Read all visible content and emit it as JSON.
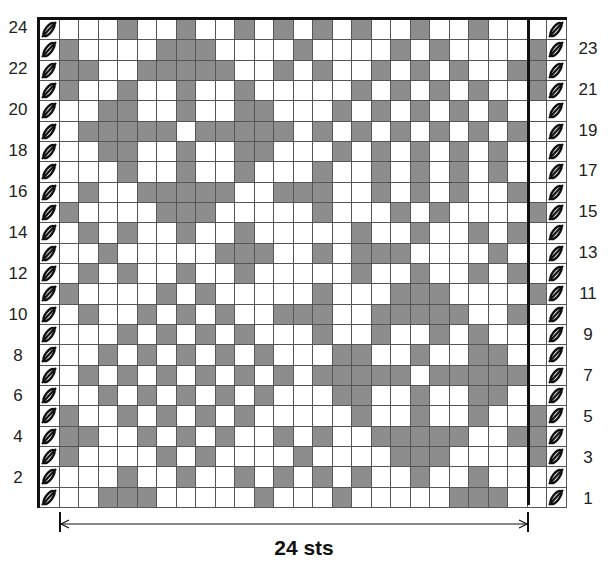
{
  "chart_data": {
    "type": "table",
    "columns": 24,
    "rows": 24,
    "legend": {
      "0": "background (white)",
      "1": "contrast (gray)",
      "edge": "edge stitch (slashed)"
    },
    "colors": {
      "contrast": "#8d8d8d",
      "background": "#ffffff",
      "border": "#111111"
    },
    "width_label": "24 sts",
    "left_row_labels": [
      "24",
      "22",
      "20",
      "18",
      "16",
      "14",
      "12",
      "10",
      "8",
      "6",
      "4",
      "2"
    ],
    "right_row_labels": [
      "23",
      "21",
      "19",
      "17",
      "15",
      "13",
      "11",
      "9",
      "7",
      "5",
      "3",
      "1"
    ],
    "grid_top_to_bottom": [
      "0001001001010101001001000",
      "1000011100001000010100001",
      "1100111110010100101010011",
      "1001001001000001010101001",
      "0011001001100010101010100",
      "0111110111110101010101010",
      "0011001001100010101010100",
      "0001001001000100101010100",
      "0100111110011100101010010",
      "1000011100000100010100001",
      "0101001001000001001001010",
      "0010000011100101110000100",
      "0101001001000001001001010",
      "1000010100000100011100001",
      "0100101010011100111110010",
      "0001010101000100100101000",
      "0010101010100011001001100",
      "0101010101010111110111110",
      "0010101010100011001001100",
      "1001010101000001001001001",
      "1100101010010100111110011",
      "1000010100001000011100001",
      "0001001001010101001001000",
      "0011100000100010000011100"
    ]
  },
  "labels": {
    "width": "24 sts"
  }
}
